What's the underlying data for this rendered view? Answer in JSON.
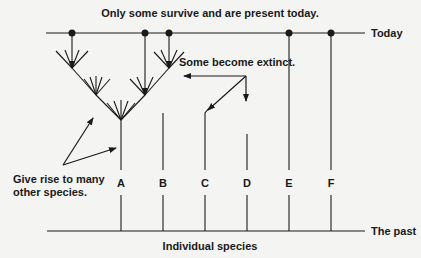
{
  "title": "Only some survive and are present today.",
  "axis": {
    "top_label": "Today",
    "bottom_label": "The past",
    "x_label": "Individual species"
  },
  "annotations": {
    "extinct": "Some become extinct.",
    "give_rise_line1": "Give rise to many",
    "give_rise_line2": "other species."
  },
  "species": [
    {
      "label": "A",
      "x": 121
    },
    {
      "label": "B",
      "x": 163
    },
    {
      "label": "C",
      "x": 205
    },
    {
      "label": "D",
      "x": 247
    },
    {
      "label": "E",
      "x": 289
    },
    {
      "label": "F",
      "x": 331
    }
  ],
  "surviving_dots_x": [
    72,
    145,
    169,
    289,
    331
  ],
  "colors": {
    "ink": "#1a1a1a",
    "background": "#f4f4f2"
  }
}
